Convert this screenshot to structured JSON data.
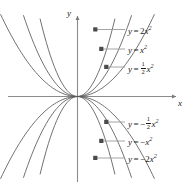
{
  "figure": {
    "background_color": "#ffffff",
    "curve_color": "#595959",
    "axis_color": "#8c8c8c",
    "text_color": "#1a1a1a",
    "width": 193,
    "height": 188
  },
  "axes": {
    "x_label": "x",
    "y_label": "y",
    "origin": {
      "x": 77,
      "y": 96
    },
    "x_range": [
      8,
      178
    ],
    "y_range": [
      14,
      182
    ],
    "arrows": [
      "x-positive",
      "y-positive"
    ],
    "ticks": "none",
    "grid": false
  },
  "labels": {
    "a": {
      "text": "y = 2x²",
      "lhs": "y",
      "eq": "=",
      "coefficient": "2",
      "x_var": "x",
      "exponent": "2",
      "fraction": null,
      "negative": false
    },
    "b": {
      "text": "y = x²",
      "lhs": "y",
      "eq": "=",
      "coefficient": "",
      "x_var": "x",
      "exponent": "2",
      "fraction": null,
      "negative": false
    },
    "c": {
      "text": "y = ½x²",
      "lhs": "y",
      "eq": "=",
      "coefficient": "",
      "x_var": "x",
      "exponent": "2",
      "fraction": {
        "numerator": "1",
        "denominator": "2"
      },
      "negative": false
    },
    "d": {
      "text": "y = -½x²",
      "lhs": "y",
      "eq": "=",
      "coefficient": "",
      "x_var": "x",
      "exponent": "2",
      "fraction": {
        "numerator": "1",
        "denominator": "2"
      },
      "negative": true,
      "minus": "−"
    },
    "e": {
      "text": "y = -x²",
      "lhs": "y",
      "eq": "=",
      "coefficient": "",
      "x_var": "x",
      "exponent": "2",
      "fraction": null,
      "negative": true,
      "minus": "−"
    },
    "f": {
      "text": "y = -2x²",
      "lhs": "y",
      "eq": "=",
      "coefficient": "2",
      "x_var": "x",
      "exponent": "2",
      "fraction": null,
      "negative": true,
      "minus": "−"
    }
  },
  "chart_data": {
    "type": "line",
    "title": "",
    "xlabel": "x",
    "ylabel": "y",
    "xlim": [
      -2.3,
      2.3
    ],
    "ylim": [
      -2.4,
      2.4
    ],
    "grid": false,
    "legend_position": "inline-callouts-right",
    "equation_form": "y = a x^2",
    "series": [
      {
        "name": "y = 2x²",
        "a": 2,
        "label_key": "a",
        "callout_anchor": {
          "x": 95,
          "y": 30
        },
        "label_pos": {
          "x": 128,
          "y": 24
        }
      },
      {
        "name": "y = x²",
        "a": 1,
        "label_key": "b",
        "callout_anchor": {
          "x": 101,
          "y": 49
        },
        "label_pos": {
          "x": 128,
          "y": 43
        }
      },
      {
        "name": "y = ½x²",
        "a": 0.5,
        "label_key": "c",
        "callout_anchor": {
          "x": 106,
          "y": 67
        },
        "label_pos": {
          "x": 128,
          "y": 60
        }
      },
      {
        "name": "y = −½x²",
        "a": -0.5,
        "label_key": "d",
        "callout_anchor": {
          "x": 106,
          "y": 122
        },
        "label_pos": {
          "x": 128,
          "y": 115
        }
      },
      {
        "name": "y = −x²",
        "a": -1,
        "label_key": "e",
        "callout_anchor": {
          "x": 101,
          "y": 141
        },
        "label_pos": {
          "x": 128,
          "y": 135
        }
      },
      {
        "name": "y = −2x²",
        "a": -2,
        "label_key": "f",
        "callout_anchor": {
          "x": 95,
          "y": 158
        },
        "label_pos": {
          "x": 128,
          "y": 152
        }
      }
    ],
    "x_samples": [
      -2.3,
      -2.0,
      -1.5,
      -1.0,
      -0.5,
      0,
      0.5,
      1.0,
      1.5,
      2.0,
      2.3
    ],
    "note": "Six parabolas sharing the vertex at the origin; three open upward (a = 2, 1, 0.5) and three open downward (a = -0.5, -1, -2). Larger |a| gives a narrower parabola."
  }
}
